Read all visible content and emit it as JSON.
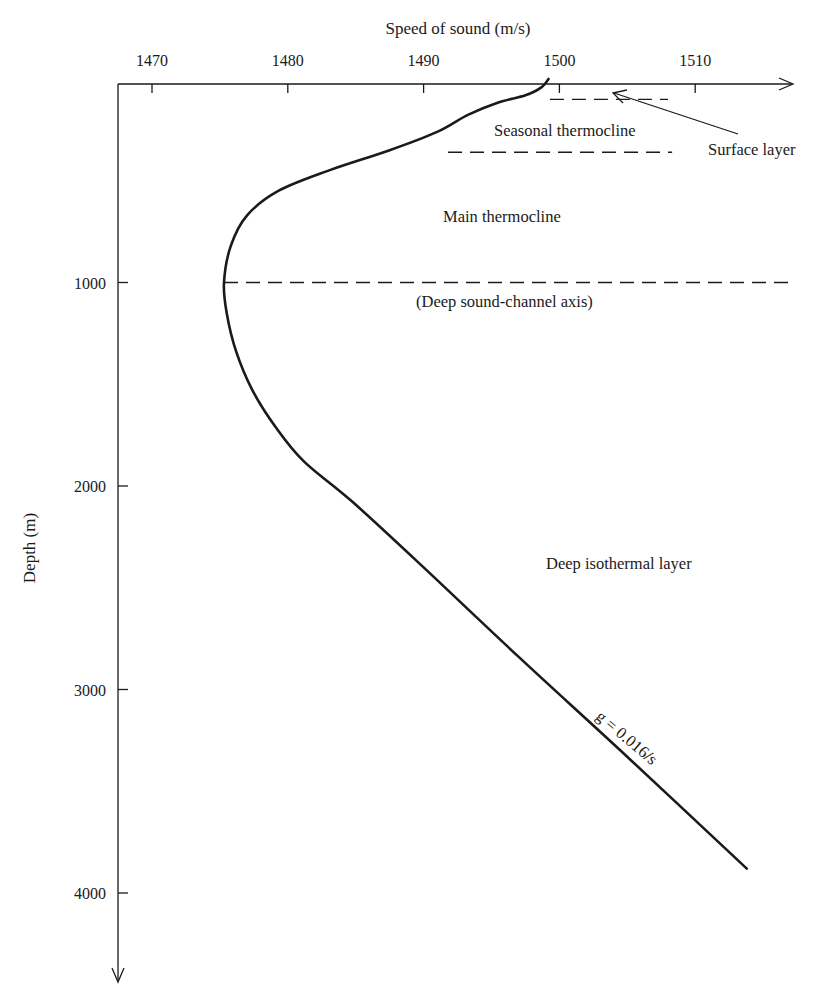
{
  "chart_data": {
    "type": "line",
    "title": "",
    "xlabel": "Speed of sound (m/s)",
    "ylabel": "Depth (m)",
    "x_axis_position": "top",
    "y_axis_inverted": true,
    "xlim": [
      1467.5,
      1517
    ],
    "ylim": [
      0,
      4400
    ],
    "xticks": [
      1470,
      1480,
      1490,
      1500,
      1510
    ],
    "yticks": [
      1000,
      2000,
      3000,
      4000
    ],
    "grid": false,
    "legend": null,
    "series": [
      {
        "name": "Sound speed profile",
        "points": [
          {
            "speed": 1499.2,
            "depth": 0
          },
          {
            "speed": 1498.7,
            "depth": 40
          },
          {
            "speed": 1497.5,
            "depth": 80
          },
          {
            "speed": 1495.5,
            "depth": 115
          },
          {
            "speed": 1493.3,
            "depth": 175
          },
          {
            "speed": 1491.0,
            "depth": 260
          },
          {
            "speed": 1487.5,
            "depth": 350
          },
          {
            "speed": 1483.0,
            "depth": 450
          },
          {
            "speed": 1479.3,
            "depth": 550
          },
          {
            "speed": 1477.0,
            "depth": 670
          },
          {
            "speed": 1475.8,
            "depth": 820
          },
          {
            "speed": 1475.3,
            "depth": 1000
          },
          {
            "speed": 1475.5,
            "depth": 1150
          },
          {
            "speed": 1476.2,
            "depth": 1340
          },
          {
            "speed": 1477.4,
            "depth": 1530
          },
          {
            "speed": 1479.1,
            "depth": 1710
          },
          {
            "speed": 1481.2,
            "depth": 1880
          },
          {
            "speed": 1484.8,
            "depth": 2080
          },
          {
            "speed": 1490.0,
            "depth": 2400
          },
          {
            "speed": 1497.0,
            "depth": 2840
          },
          {
            "speed": 1504.5,
            "depth": 3300
          },
          {
            "speed": 1513.8,
            "depth": 3880
          }
        ]
      }
    ],
    "reference_lines": [
      {
        "name": "Surface layer boundary",
        "depth": 100,
        "speed_from": 1499.3,
        "speed_to": 1508.0,
        "style": "dashed"
      },
      {
        "name": "Seasonal thermocline boundary",
        "depth": 360,
        "speed_from": 1491.8,
        "speed_to": 1508.3,
        "style": "dashed"
      },
      {
        "name": "Deep sound-channel axis",
        "depth": 1000,
        "speed_from": 1475.3,
        "speed_to": 1517.0,
        "style": "dashed"
      }
    ],
    "annotations": [
      {
        "text": "Surface layer",
        "anchor_speed": 1515.3,
        "anchor_depth": 370,
        "arrow_to_speed": 1503.9,
        "arrow_to_depth": 60
      },
      {
        "text": "Seasonal thermocline",
        "speed": 1500.5,
        "depth": 240
      },
      {
        "text": "Main thermocline",
        "speed": 1497.0,
        "depth": 670
      },
      {
        "text": "(Deep sound-channel axis)",
        "speed": 1498.5,
        "depth": 1100
      },
      {
        "text": "Deep isothermal layer",
        "speed": 1505.0,
        "depth": 2430
      },
      {
        "text": "g = 0.016/s",
        "speed": 1506.2,
        "depth": 3380,
        "rotation_deg": 40
      }
    ]
  },
  "labels": {
    "x_axis_title": "Speed of sound (m/s)",
    "y_axis_title": "Depth (m)",
    "x_ticks": [
      "1470",
      "1480",
      "1490",
      "1500",
      "1510"
    ],
    "y_ticks": [
      "1000",
      "2000",
      "3000",
      "4000"
    ],
    "surface_layer": "Surface layer",
    "seasonal_thermocline": "Seasonal thermocline",
    "main_thermocline": "Main thermocline",
    "deep_channel_axis": "(Deep sound-channel axis)",
    "deep_isothermal": "Deep isothermal layer",
    "gradient": "g = 0.016/s"
  },
  "colors": {
    "ink": "#1a1a1a",
    "background": "#ffffff"
  }
}
